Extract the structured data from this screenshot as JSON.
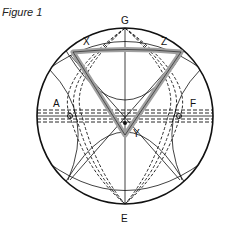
{
  "figure": {
    "title": "Figure 1",
    "labels": {
      "top": "G",
      "bottom": "E",
      "left": "A",
      "right": "F",
      "triangle_left": "X",
      "triangle_right": "Z",
      "triangle_bottom": "Y"
    },
    "colors": {
      "outline": "#111111",
      "triangle_fill": "#a0a0a0",
      "background": "#ffffff"
    }
  }
}
